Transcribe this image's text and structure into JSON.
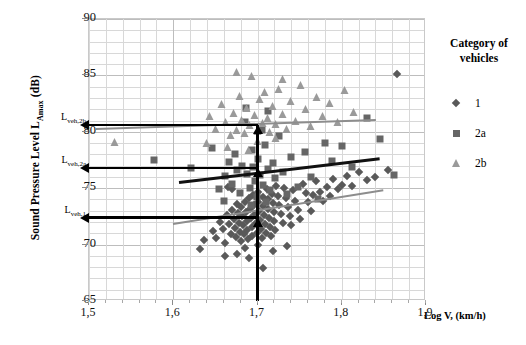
{
  "chart_data": {
    "type": "scatter",
    "title": "",
    "xlabel": "Log V, (km/h)",
    "ylabel": "Sound Pressure Level L_Amax (dB)",
    "ylabel_main": "Sound Pressure Level L",
    "ylabel_sub": "Amax",
    "ylabel_unit": " (dB)",
    "xlim": [
      1.5,
      1.9
    ],
    "ylim": [
      65,
      90
    ],
    "xticks": [
      "1,5",
      "1,6",
      "1,7",
      "1,8",
      "1,9"
    ],
    "xtick_values": [
      1.5,
      1.6,
      1.7,
      1.8,
      1.9
    ],
    "yticks": [
      "90",
      "85",
      "80",
      "75",
      "70",
      "65"
    ],
    "ytick_values": [
      90,
      85,
      80,
      75,
      70,
      65
    ],
    "grid": true,
    "grid_minor_x": 0.02,
    "grid_minor_y": 1,
    "legend_position": "right",
    "legend_title_line1": "Category of",
    "legend_title_line2": "vehicles",
    "series": [
      {
        "name": "1",
        "marker": "diamond",
        "color": "#595959",
        "points": [
          [
            1.636,
            70.4
          ],
          [
            1.647,
            71.2
          ],
          [
            1.651,
            70.6
          ],
          [
            1.655,
            72.0
          ],
          [
            1.659,
            71.4
          ],
          [
            1.662,
            70.1
          ],
          [
            1.664,
            72.6
          ],
          [
            1.666,
            71.8
          ],
          [
            1.668,
            70.9
          ],
          [
            1.67,
            73.1
          ],
          [
            1.672,
            72.3
          ],
          [
            1.673,
            71.5
          ],
          [
            1.675,
            70.7
          ],
          [
            1.676,
            73.6
          ],
          [
            1.677,
            72.8
          ],
          [
            1.678,
            71.9
          ],
          [
            1.679,
            71.1
          ],
          [
            1.68,
            70.3
          ],
          [
            1.681,
            73.3
          ],
          [
            1.682,
            72.5
          ],
          [
            1.683,
            71.7
          ],
          [
            1.684,
            70.9
          ],
          [
            1.685,
            73.8
          ],
          [
            1.686,
            72.9
          ],
          [
            1.687,
            72.1
          ],
          [
            1.688,
            71.3
          ],
          [
            1.689,
            70.5
          ],
          [
            1.69,
            74.1
          ],
          [
            1.691,
            73.2
          ],
          [
            1.692,
            72.4
          ],
          [
            1.693,
            71.6
          ],
          [
            1.694,
            70.8
          ],
          [
            1.695,
            74.4
          ],
          [
            1.696,
            73.5
          ],
          [
            1.697,
            72.7
          ],
          [
            1.698,
            71.9
          ],
          [
            1.699,
            71.0
          ],
          [
            1.7,
            74.7
          ],
          [
            1.701,
            73.8
          ],
          [
            1.702,
            73.0
          ],
          [
            1.703,
            72.2
          ],
          [
            1.704,
            71.4
          ],
          [
            1.705,
            70.6
          ],
          [
            1.706,
            74.2
          ],
          [
            1.707,
            73.4
          ],
          [
            1.708,
            72.6
          ],
          [
            1.709,
            71.8
          ],
          [
            1.71,
            71.0
          ],
          [
            1.711,
            74.9
          ],
          [
            1.712,
            74.0
          ],
          [
            1.713,
            73.2
          ],
          [
            1.714,
            72.4
          ],
          [
            1.715,
            71.6
          ],
          [
            1.716,
            70.8
          ],
          [
            1.717,
            74.5
          ],
          [
            1.718,
            73.7
          ],
          [
            1.719,
            72.9
          ],
          [
            1.72,
            72.1
          ],
          [
            1.721,
            71.3
          ],
          [
            1.722,
            75.2
          ],
          [
            1.724,
            74.3
          ],
          [
            1.726,
            73.5
          ],
          [
            1.728,
            72.7
          ],
          [
            1.73,
            71.9
          ],
          [
            1.732,
            75.0
          ],
          [
            1.734,
            74.1
          ],
          [
            1.736,
            73.3
          ],
          [
            1.738,
            72.5
          ],
          [
            1.74,
            71.7
          ],
          [
            1.742,
            74.8
          ],
          [
            1.745,
            73.9
          ],
          [
            1.748,
            73.1
          ],
          [
            1.751,
            72.3
          ],
          [
            1.754,
            75.4
          ],
          [
            1.757,
            74.6
          ],
          [
            1.76,
            73.8
          ],
          [
            1.763,
            73.0
          ],
          [
            1.766,
            74.4
          ],
          [
            1.77,
            75.6
          ],
          [
            1.774,
            74.7
          ],
          [
            1.778,
            73.9
          ],
          [
            1.782,
            75.1
          ],
          [
            1.786,
            74.3
          ],
          [
            1.79,
            75.8
          ],
          [
            1.795,
            74.9
          ],
          [
            1.8,
            75.3
          ],
          [
            1.806,
            76.1
          ],
          [
            1.812,
            75.2
          ],
          [
            1.82,
            76.4
          ],
          [
            1.83,
            75.7
          ],
          [
            1.84,
            76.0
          ],
          [
            1.855,
            76.6
          ],
          [
            1.866,
            85.1
          ],
          [
            1.707,
            67.9
          ],
          [
            1.676,
            69.2
          ],
          [
            1.632,
            69.6
          ],
          [
            1.662,
            69.0
          ],
          [
            1.69,
            68.8
          ],
          [
            1.718,
            69.4
          ],
          [
            1.735,
            69.9
          ],
          [
            1.7,
            70.0
          ],
          [
            1.685,
            69.7
          ],
          [
            1.67,
            74.9
          ],
          [
            1.665,
            75.1
          ]
        ]
      },
      {
        "name": "2a",
        "marker": "square",
        "color": "#666666",
        "points": [
          [
            1.577,
            77.5
          ],
          [
            1.621,
            76.8
          ],
          [
            1.646,
            78.6
          ],
          [
            1.654,
            74.9
          ],
          [
            1.661,
            76.1
          ],
          [
            1.666,
            77.3
          ],
          [
            1.67,
            75.4
          ],
          [
            1.673,
            78.0
          ],
          [
            1.676,
            76.6
          ],
          [
            1.679,
            74.6
          ],
          [
            1.682,
            77.0
          ],
          [
            1.685,
            80.9
          ],
          [
            1.688,
            76.3
          ],
          [
            1.691,
            75.0
          ],
          [
            1.693,
            78.4
          ],
          [
            1.695,
            76.9
          ],
          [
            1.697,
            75.6
          ],
          [
            1.699,
            74.2
          ],
          [
            1.701,
            77.6
          ],
          [
            1.703,
            76.2
          ],
          [
            1.705,
            80.2
          ],
          [
            1.707,
            75.3
          ],
          [
            1.709,
            78.8
          ],
          [
            1.712,
            76.7
          ],
          [
            1.715,
            74.8
          ],
          [
            1.718,
            77.2
          ],
          [
            1.721,
            75.9
          ],
          [
            1.725,
            79.6
          ],
          [
            1.73,
            76.4
          ],
          [
            1.735,
            74.5
          ],
          [
            1.74,
            77.8
          ],
          [
            1.748,
            75.1
          ],
          [
            1.756,
            78.2
          ],
          [
            1.764,
            76.0
          ],
          [
            1.772,
            74.0
          ],
          [
            1.78,
            79.0
          ],
          [
            1.788,
            77.4
          ],
          [
            1.8,
            78.7
          ],
          [
            1.812,
            76.9
          ],
          [
            1.83,
            81.2
          ],
          [
            1.845,
            79.4
          ],
          [
            1.862,
            76.2
          ],
          [
            1.66,
            73.9
          ],
          [
            1.692,
            73.5
          ],
          [
            1.71,
            73.8
          ],
          [
            1.686,
            82.1
          ],
          [
            1.713,
            81.8
          ]
        ]
      },
      {
        "name": "2b",
        "marker": "triangle",
        "color": "#9a9a9a",
        "points": [
          [
            1.531,
            79.0
          ],
          [
            1.644,
            81.3
          ],
          [
            1.651,
            80.2
          ],
          [
            1.658,
            82.4
          ],
          [
            1.663,
            80.8
          ],
          [
            1.668,
            79.6
          ],
          [
            1.672,
            81.6
          ],
          [
            1.676,
            80.1
          ],
          [
            1.679,
            83.1
          ],
          [
            1.682,
            81.0
          ],
          [
            1.685,
            79.8
          ],
          [
            1.688,
            82.0
          ],
          [
            1.691,
            80.5
          ],
          [
            1.694,
            84.9
          ],
          [
            1.697,
            81.4
          ],
          [
            1.7,
            80.0
          ],
          [
            1.703,
            82.8
          ],
          [
            1.706,
            80.7
          ],
          [
            1.709,
            83.4
          ],
          [
            1.712,
            81.1
          ],
          [
            1.715,
            79.9
          ],
          [
            1.718,
            82.2
          ],
          [
            1.722,
            80.6
          ],
          [
            1.726,
            83.7
          ],
          [
            1.73,
            81.5
          ],
          [
            1.735,
            80.2
          ],
          [
            1.74,
            82.6
          ],
          [
            1.746,
            80.9
          ],
          [
            1.752,
            84.1
          ],
          [
            1.758,
            81.9
          ],
          [
            1.764,
            80.4
          ],
          [
            1.771,
            83.0
          ],
          [
            1.778,
            81.3
          ],
          [
            1.786,
            82.5
          ],
          [
            1.795,
            80.8
          ],
          [
            1.804,
            83.6
          ],
          [
            1.815,
            81.7
          ],
          [
            1.64,
            78.9
          ],
          [
            1.665,
            78.6
          ],
          [
            1.69,
            78.3
          ],
          [
            1.676,
            85.2
          ],
          [
            1.73,
            84.6
          ],
          [
            1.7,
            79.1
          ],
          [
            1.722,
            79.4
          ]
        ]
      }
    ],
    "trendlines": [
      {
        "name": "trend-1",
        "series": "1",
        "color": "#8d8d8d",
        "x0": 1.6,
        "y0": 71.9,
        "x1": 1.85,
        "y1": 74.9
      },
      {
        "name": "trend-2a",
        "series": "2a",
        "color": "#111111",
        "x0": 1.607,
        "y0": 75.6,
        "x1": 1.845,
        "y1": 77.7
      },
      {
        "name": "trend-2b",
        "series": "2b",
        "color": "#8d8d8d",
        "x0": 1.508,
        "y0": 80.3,
        "x1": 1.84,
        "y1": 81.1
      }
    ],
    "annotations": [
      {
        "name": "L_veh,2b",
        "label_main": "L",
        "label_sub": "veh,2b",
        "value": 80.6,
        "x_from": 1.7
      },
      {
        "name": "L_veh,2a",
        "label_main": "L",
        "label_sub": "veh,2a",
        "value": 76.8,
        "x_from": 1.7
      },
      {
        "name": "L_veh,1",
        "label_main": "L",
        "label_sub": "veh,1",
        "value": 72.4,
        "x_from": 1.7
      }
    ],
    "vertical_marker_x": 1.7
  },
  "legend": {
    "title_line1": "Category of",
    "title_line2": "vehicles",
    "items": [
      {
        "label": "1",
        "marker": "diamond-icon",
        "color": "#595959"
      },
      {
        "label": "2a",
        "marker": "square-icon",
        "color": "#666666"
      },
      {
        "label": "2b",
        "marker": "triangle-icon",
        "color": "#9a9a9a"
      }
    ]
  }
}
